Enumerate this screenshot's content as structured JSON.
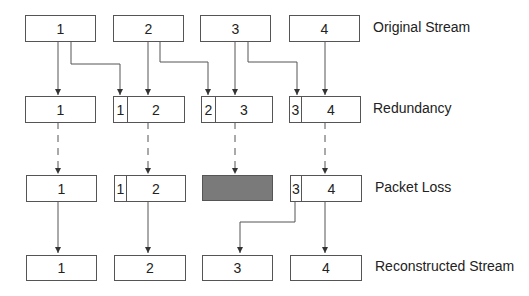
{
  "rows": [
    {
      "label": "Original Stream",
      "packets": [
        {
          "main": "1"
        },
        {
          "main": "2"
        },
        {
          "main": "3"
        },
        {
          "main": "4"
        }
      ]
    },
    {
      "label": "Redundancy",
      "packets": [
        {
          "main": "1"
        },
        {
          "redundant": "1",
          "main": "2"
        },
        {
          "redundant": "2",
          "main": "3"
        },
        {
          "redundant": "3",
          "main": "4"
        }
      ]
    },
    {
      "label": "Packet Loss",
      "packets": [
        {
          "main": "1"
        },
        {
          "redundant": "1",
          "main": "2"
        },
        {
          "lost": true
        },
        {
          "redundant": "3",
          "main": "4"
        }
      ]
    },
    {
      "label": "Reconstructed Stream",
      "packets": [
        {
          "main": "1"
        },
        {
          "main": "2"
        },
        {
          "main": "3"
        },
        {
          "main": "4"
        }
      ]
    }
  ],
  "colors": {
    "lost_packet": "#7a7a7a",
    "line": "#555555"
  }
}
